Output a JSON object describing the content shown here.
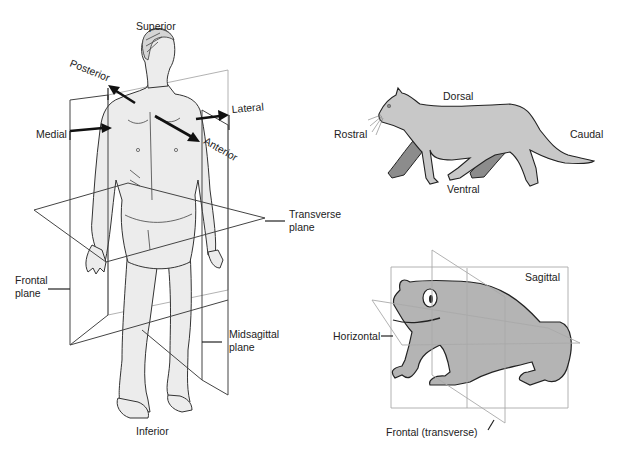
{
  "human": {
    "labels": {
      "superior": "Superior",
      "inferior": "Inferior",
      "posterior": "Posterior",
      "anterior": "Anterior",
      "medial": "Medial",
      "lateral": "Lateral",
      "transverse_l1": "Transverse",
      "transverse_l2": "plane",
      "frontal_l1": "Frontal",
      "frontal_l2": "plane",
      "midsagittal_l1": "Midsagittal",
      "midsagittal_l2": "plane"
    }
  },
  "cat": {
    "labels": {
      "dorsal": "Dorsal",
      "ventral": "Ventral",
      "rostral": "Rostral",
      "caudal": "Caudal"
    },
    "colors": {
      "body": "#c8c8c8",
      "far_legs": "#8c8c8c"
    }
  },
  "frog": {
    "labels": {
      "sagittal": "Sagittal",
      "horizontal": "Horizontal",
      "frontal": "Frontal (transverse)"
    },
    "colors": {
      "body": "#b4b4b4"
    }
  }
}
